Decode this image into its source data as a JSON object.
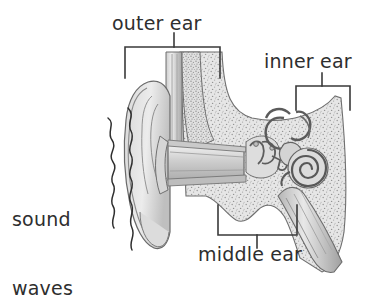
{
  "figure": {
    "background_color": "#ffffff",
    "line_color": "#3a3a3a",
    "text_color": "#2e2e2e",
    "fill_light": "#e4e4e4",
    "fill_mid": "#c9c9c9",
    "fill_dark": "#a8a8a8"
  },
  "labels": {
    "outer_ear": "outer ear",
    "inner_ear": "inner ear",
    "middle_ear": "middle ear",
    "sound_waves_line1": "sound",
    "sound_waves_line2": "waves"
  },
  "brackets": {
    "outer_ear": {
      "orientation": "down",
      "x1": 125,
      "x2": 220,
      "y": 47,
      "leg": 31,
      "tick_x": 174,
      "tick_top": 33
    },
    "inner_ear": {
      "orientation": "down",
      "x1": 296,
      "x2": 350,
      "y": 86,
      "leg": 24,
      "tick_x": 322,
      "tick_top": 73
    },
    "middle_ear": {
      "orientation": "up",
      "x1": 218,
      "x2": 297,
      "y": 235,
      "leg": 30,
      "tick_x": 257,
      "tick_bottom": 248
    }
  },
  "structures": [
    {
      "name": "pinna",
      "region": "outer ear",
      "description": "auricle with helix and antihelix folds"
    },
    {
      "name": "ear-canal",
      "region": "outer ear",
      "description": "external auditory meatus"
    },
    {
      "name": "eardrum",
      "region": "middle ear",
      "description": "tympanic membrane"
    },
    {
      "name": "ossicles",
      "region": "middle ear",
      "description": "malleus, incus and stapes"
    },
    {
      "name": "eustachian-tube",
      "region": "middle ear",
      "description": "auditory tube descending to throat"
    },
    {
      "name": "semicircular-canals",
      "region": "inner ear",
      "description": "three looping balance canals"
    },
    {
      "name": "cochlea",
      "region": "inner ear",
      "description": "spiral hearing organ"
    },
    {
      "name": "temporal-bone",
      "region": "skull",
      "description": "stippled bone surrounding the ear"
    },
    {
      "name": "sound-waves",
      "region": "outside",
      "description": "two wavy lines travelling toward the pinna"
    }
  ]
}
